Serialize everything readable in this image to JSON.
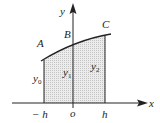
{
  "diagram": {
    "axes": {
      "x_label": "x",
      "y_label": "y"
    },
    "points": {
      "A": "A",
      "B": "B",
      "C": "C"
    },
    "ordinates": [
      {
        "base": "y",
        "sub": "0"
      },
      {
        "base": "y",
        "sub": "1"
      },
      {
        "base": "y",
        "sub": "2"
      }
    ],
    "ticks": {
      "left": "− h",
      "origin": "o",
      "right": "h"
    },
    "colors": {
      "stroke": "#222222",
      "fill": "#d9d9d9"
    }
  }
}
